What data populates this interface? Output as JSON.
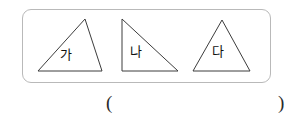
{
  "figure": {
    "name": "three-triangles-figure",
    "frame": {
      "shape": "rounded-rectangle",
      "border_color": "#b9b9b9",
      "background_color": "#ffffff"
    },
    "stroke_color": "#3c3c3c",
    "shapes": [
      {
        "id": "triangle-ga",
        "label": "가",
        "kind": "triangle",
        "description": "obtuse scalene triangle, apex at upper right",
        "points": "16,62 80,62 63,10"
      },
      {
        "id": "triangle-na",
        "label": "나",
        "kind": "triangle",
        "description": "right triangle, right angle at lower left",
        "points": "100,10 100,62 156,62"
      },
      {
        "id": "triangle-da",
        "label": "다",
        "kind": "triangle",
        "description": "isosceles triangle, apex at top center",
        "points": "171,62 228,62 200,11"
      }
    ]
  },
  "answer": {
    "open_paren": "(",
    "close_paren": ")",
    "value": ""
  }
}
